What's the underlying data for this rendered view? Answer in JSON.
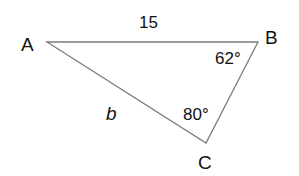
{
  "diagram": {
    "type": "triangle",
    "vertices": {
      "A": {
        "label": "A"
      },
      "B": {
        "label": "B"
      },
      "C": {
        "label": "C"
      }
    },
    "sides": {
      "AB": {
        "label": "15"
      },
      "AC": {
        "label": "b"
      }
    },
    "angles": {
      "B": {
        "label": "62°"
      },
      "C": {
        "label": "80°"
      }
    },
    "colors": {
      "line": "#777777",
      "text": "#111111"
    }
  }
}
